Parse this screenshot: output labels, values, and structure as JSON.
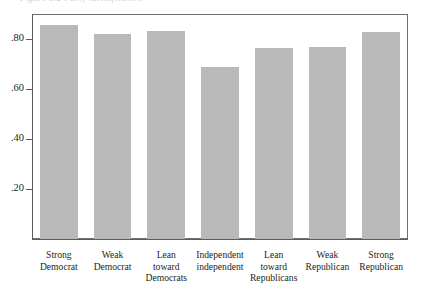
{
  "figure": {
    "title_remnant": "Figure 5.2   Party identification",
    "background_color": "#ffffff",
    "frame_color": "#6f6f6f",
    "bar_color": "#b9b9b9",
    "text_color": "#231f20"
  },
  "axes": {
    "y_tick_labels": [
      ".80",
      ".60",
      ".40",
      ".20"
    ],
    "y_tick_values": [
      0.8,
      0.6,
      0.4,
      0.2
    ],
    "y_min": 0,
    "y_max": 0.9,
    "grid": "off"
  },
  "chart_data": {
    "type": "bar",
    "title": "",
    "xlabel": "",
    "ylabel": "",
    "ylim": [
      0,
      0.9
    ],
    "grid": false,
    "legend": "none",
    "bar_color": "#b9b9b9",
    "categories": [
      "Strong Democrat",
      "Weak Democrat",
      "Lean toward Democrats",
      "Independent independent",
      "Lean toward Republicans",
      "Weak Republican",
      "Strong Republican"
    ],
    "category_lines": [
      [
        "Strong",
        "Democrat"
      ],
      [
        "Weak",
        "Democrat"
      ],
      [
        "Lean",
        "toward",
        "Democrats"
      ],
      [
        "Independent",
        "independent"
      ],
      [
        "Lean",
        "toward",
        "Republicans"
      ],
      [
        "Weak",
        "Republican"
      ],
      [
        "Strong",
        "Republican"
      ]
    ],
    "values": [
      0.855,
      0.82,
      0.832,
      0.688,
      0.764,
      0.77,
      0.83
    ],
    "axis_tick_labels": [
      ".80",
      ".60",
      ".40",
      ".20"
    ],
    "axis_tick_values": [
      0.8,
      0.6,
      0.4,
      0.2
    ]
  }
}
